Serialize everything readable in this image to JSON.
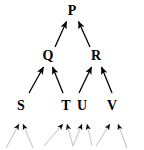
{
  "diagram": {
    "type": "directed-acyclic-graph",
    "title": "",
    "orientation": "bottom-up",
    "background_color": "#ffffff",
    "edge_color": "#000000",
    "faded_edge_color": "#c8c8c8",
    "label_color": "#000000",
    "levels": [
      {
        "name": "level-1",
        "nodes": [
          "P"
        ]
      },
      {
        "name": "level-2",
        "nodes": [
          "Q",
          "R"
        ]
      },
      {
        "name": "level-3",
        "nodes": [
          "S",
          "T",
          "U",
          "V"
        ]
      }
    ],
    "nodes": [
      {
        "id": "P",
        "label": "P",
        "x": 72,
        "y": 11,
        "level": 1
      },
      {
        "id": "Q",
        "label": "Q",
        "x": 48,
        "y": 56,
        "level": 2
      },
      {
        "id": "R",
        "label": "R",
        "x": 96,
        "y": 56,
        "level": 2
      },
      {
        "id": "S",
        "label": "S",
        "x": 21,
        "y": 106,
        "level": 3
      },
      {
        "id": "T",
        "label": "T",
        "x": 66,
        "y": 106,
        "level": 3
      },
      {
        "id": "U",
        "label": "U",
        "x": 82,
        "y": 106,
        "level": 3
      },
      {
        "id": "V",
        "label": "V",
        "x": 112,
        "y": 106,
        "level": 3
      }
    ],
    "edges": [
      {
        "from": "Q",
        "to": "P",
        "style": "solid"
      },
      {
        "from": "R",
        "to": "P",
        "style": "solid"
      },
      {
        "from": "S",
        "to": "Q",
        "style": "solid"
      },
      {
        "from": "T",
        "to": "Q",
        "style": "solid"
      },
      {
        "from": "U",
        "to": "R",
        "style": "solid"
      },
      {
        "from": "V",
        "to": "R",
        "style": "solid"
      }
    ],
    "faded_edges": [
      {
        "to": "S",
        "style": "faded"
      },
      {
        "to": "S",
        "style": "faded"
      },
      {
        "to": "T",
        "style": "faded"
      },
      {
        "to": "T",
        "style": "faded"
      },
      {
        "to": "U",
        "style": "faded"
      },
      {
        "to": "U",
        "style": "faded"
      },
      {
        "to": "V",
        "style": "faded"
      },
      {
        "to": "V",
        "style": "faded"
      }
    ]
  }
}
